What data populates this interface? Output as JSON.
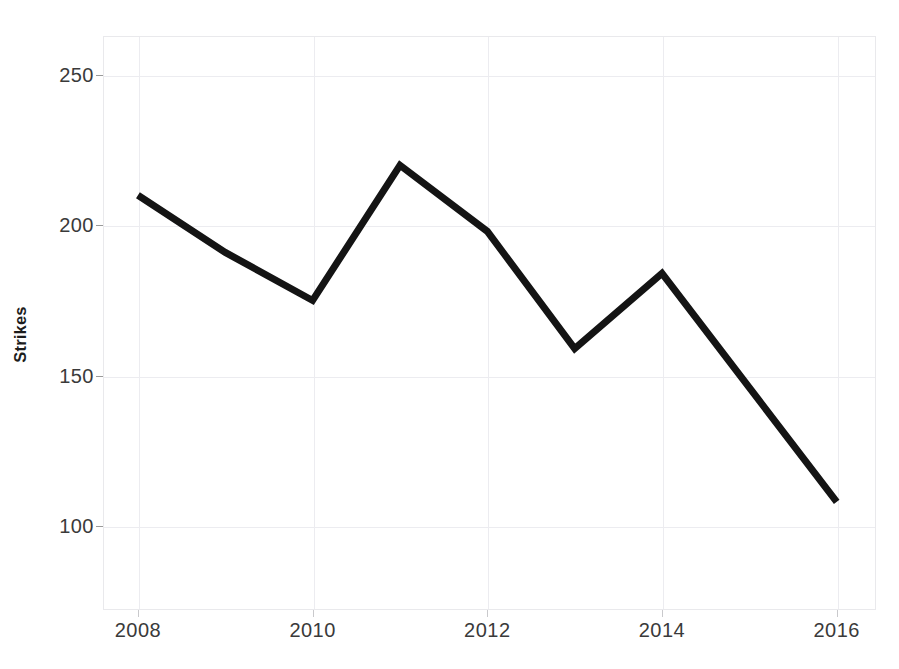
{
  "chart_data": {
    "type": "line",
    "title": "",
    "subtitle": "",
    "xlabel": "",
    "ylabel": "Strikes",
    "x": [
      2008,
      2009,
      2010,
      2011,
      2012,
      2013,
      2014,
      2015,
      2016
    ],
    "values": [
      210,
      191,
      175,
      220,
      198,
      159,
      184,
      146,
      108
    ],
    "series": [
      {
        "name": "Strikes",
        "values": [
          210,
          191,
          175,
          220,
          198,
          159,
          184,
          146,
          108
        ],
        "color": "#141414"
      }
    ],
    "xlim": [
      2007.6,
      2016.45
    ],
    "ylim": [
      72,
      263
    ],
    "x_ticks": [
      2008,
      2010,
      2012,
      2014,
      2016
    ],
    "x_tick_labels": [
      "2008",
      "2010",
      "2012",
      "2014",
      "2016"
    ],
    "y_ticks": [
      100,
      150,
      200,
      250
    ],
    "y_tick_labels": [
      "100",
      "150",
      "200",
      "250"
    ],
    "grid": true,
    "grid_color": "#ececf0",
    "legend": false,
    "legend_position": "none",
    "line_color": "#141414",
    "line_width": 7,
    "markers": false,
    "background_color": "#ffffff",
    "annotations": []
  },
  "axes": {
    "y_title": "Strikes",
    "y_tick_labels": [
      "250",
      "200",
      "150",
      "100"
    ],
    "x_tick_labels": [
      "2008",
      "2010",
      "2012",
      "2014",
      "2016"
    ]
  }
}
